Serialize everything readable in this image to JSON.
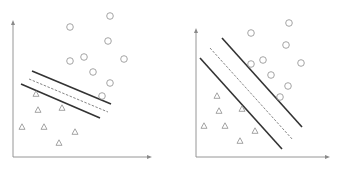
{
  "colors": {
    "axis": "#8a8a8a",
    "margin_line": "#333333",
    "decision_line": "#777777",
    "marker": "#9a9a9a",
    "background": "#ffffff"
  },
  "panels": [
    {
      "name": "narrow-margin",
      "axes": {
        "origin": [
          13,
          157
        ],
        "y_top": 20,
        "x_right": 152
      },
      "circles": [
        [
          70,
          27
        ],
        [
          110,
          16
        ],
        [
          108,
          41
        ],
        [
          70,
          61
        ],
        [
          84,
          57
        ],
        [
          124,
          59
        ],
        [
          93,
          72
        ],
        [
          110,
          83
        ],
        [
          102,
          96
        ]
      ],
      "triangles": [
        [
          36,
          94
        ],
        [
          38,
          110
        ],
        [
          62,
          108
        ],
        [
          22,
          127
        ],
        [
          44,
          127
        ],
        [
          75,
          132
        ],
        [
          59,
          143
        ]
      ],
      "lines": {
        "upper_margin": [
          [
            32,
            71
          ],
          [
            111,
            104
          ]
        ],
        "decision_boundary": [
          [
            29,
            79
          ],
          [
            108,
            112
          ]
        ],
        "lower_margin": [
          [
            21,
            84
          ],
          [
            100,
            118
          ]
        ]
      }
    },
    {
      "name": "wide-margin",
      "axes": {
        "origin": [
          196,
          157
        ],
        "y_top": 28,
        "x_right": 330
      },
      "circles": [
        [
          251,
          33
        ],
        [
          289,
          23
        ],
        [
          286,
          45
        ],
        [
          251,
          64
        ],
        [
          263,
          60
        ],
        [
          301,
          63
        ],
        [
          271,
          75
        ],
        [
          288,
          86
        ],
        [
          280,
          97
        ]
      ],
      "triangles": [
        [
          217,
          96
        ],
        [
          219,
          111
        ],
        [
          242,
          109
        ],
        [
          204,
          126
        ],
        [
          225,
          126
        ],
        [
          255,
          131
        ],
        [
          240,
          141
        ]
      ],
      "lines": {
        "upper_margin": [
          [
            222,
            38
          ],
          [
            302,
            127
          ]
        ],
        "decision_boundary": [
          [
            210,
            48
          ],
          [
            293,
            140
          ]
        ],
        "lower_margin": [
          [
            200,
            58
          ],
          [
            282,
            149
          ]
        ]
      }
    }
  ]
}
